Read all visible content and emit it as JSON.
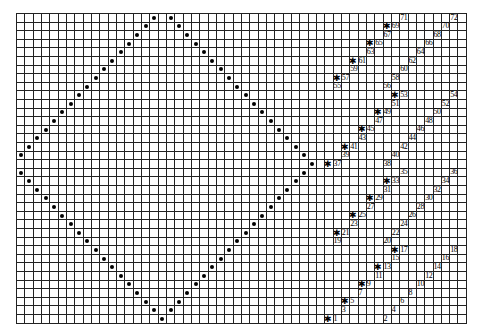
{
  "grid": {
    "cols": 54,
    "rows": 36,
    "cell_w": 8.33,
    "cell_h": 8.6,
    "line_color": "#222222"
  },
  "diamond_dots": [
    [
      0,
      16
    ],
    [
      0,
      18
    ],
    [
      1,
      15
    ],
    [
      1,
      19
    ],
    [
      2,
      14
    ],
    [
      2,
      20
    ],
    [
      3,
      13
    ],
    [
      3,
      21
    ],
    [
      4,
      12
    ],
    [
      4,
      22
    ],
    [
      5,
      11
    ],
    [
      5,
      23
    ],
    [
      6,
      10
    ],
    [
      6,
      24
    ],
    [
      7,
      9
    ],
    [
      7,
      25
    ],
    [
      8,
      8
    ],
    [
      8,
      26
    ],
    [
      9,
      7
    ],
    [
      9,
      27
    ],
    [
      10,
      6
    ],
    [
      10,
      28
    ],
    [
      11,
      5
    ],
    [
      11,
      29
    ],
    [
      12,
      4
    ],
    [
      12,
      30
    ],
    [
      13,
      3
    ],
    [
      13,
      31
    ],
    [
      14,
      2
    ],
    [
      14,
      32
    ],
    [
      15,
      1
    ],
    [
      15,
      33
    ],
    [
      16,
      0
    ],
    [
      16,
      34
    ],
    [
      17,
      35
    ],
    [
      18,
      0
    ],
    [
      18,
      34
    ],
    [
      19,
      1
    ],
    [
      19,
      33
    ],
    [
      20,
      2
    ],
    [
      20,
      32
    ],
    [
      21,
      3
    ],
    [
      21,
      31
    ],
    [
      22,
      4
    ],
    [
      22,
      30
    ],
    [
      23,
      5
    ],
    [
      23,
      29
    ],
    [
      24,
      6
    ],
    [
      24,
      28
    ],
    [
      25,
      7
    ],
    [
      25,
      27
    ],
    [
      26,
      8
    ],
    [
      26,
      26
    ],
    [
      27,
      9
    ],
    [
      27,
      25
    ],
    [
      28,
      10
    ],
    [
      28,
      24
    ],
    [
      29,
      11
    ],
    [
      29,
      23
    ],
    [
      30,
      12
    ],
    [
      30,
      22
    ],
    [
      31,
      13
    ],
    [
      31,
      21
    ],
    [
      32,
      14
    ],
    [
      32,
      20
    ],
    [
      33,
      15
    ],
    [
      33,
      19
    ],
    [
      34,
      16
    ],
    [
      34,
      18
    ],
    [
      35,
      17
    ]
  ],
  "star_symbol": "✱",
  "labels": [
    {
      "text": "1",
      "row": 35,
      "col": 38,
      "star": 37
    },
    {
      "text": "2",
      "row": 35,
      "col": 44
    },
    {
      "text": "3",
      "row": 34,
      "col": 39
    },
    {
      "text": "4",
      "row": 34,
      "col": 45
    },
    {
      "text": "5",
      "row": 33,
      "col": 40,
      "star": 39
    },
    {
      "text": "6",
      "row": 33,
      "col": 46
    },
    {
      "text": "7",
      "row": 32,
      "col": 41
    },
    {
      "text": "8",
      "row": 32,
      "col": 47
    },
    {
      "text": "9",
      "row": 31,
      "col": 42,
      "star": 41
    },
    {
      "text": "10",
      "row": 31,
      "col": 48
    },
    {
      "text": "11",
      "row": 30,
      "col": 43
    },
    {
      "text": "12",
      "row": 30,
      "col": 49
    },
    {
      "text": "13",
      "row": 29,
      "col": 44,
      "star": 43
    },
    {
      "text": "14",
      "row": 29,
      "col": 50
    },
    {
      "text": "15",
      "row": 28,
      "col": 45
    },
    {
      "text": "16",
      "row": 28,
      "col": 51
    },
    {
      "text": "17",
      "row": 27,
      "col": 46,
      "star": 45
    },
    {
      "text": "18",
      "row": 27,
      "col": 52
    },
    {
      "text": "19",
      "row": 26,
      "col": 38
    },
    {
      "text": "20",
      "row": 26,
      "col": 44
    },
    {
      "text": "21",
      "row": 25,
      "col": 39,
      "star": 38
    },
    {
      "text": "22",
      "row": 25,
      "col": 45
    },
    {
      "text": "23",
      "row": 24,
      "col": 40
    },
    {
      "text": "24",
      "row": 24,
      "col": 46
    },
    {
      "text": "25",
      "row": 23,
      "col": 41,
      "star": 40
    },
    {
      "text": "26",
      "row": 23,
      "col": 47
    },
    {
      "text": "27",
      "row": 22,
      "col": 42
    },
    {
      "text": "28",
      "row": 22,
      "col": 48
    },
    {
      "text": "29",
      "row": 21,
      "col": 43,
      "star": 42
    },
    {
      "text": "30",
      "row": 21,
      "col": 49
    },
    {
      "text": "31",
      "row": 20,
      "col": 44
    },
    {
      "text": "32",
      "row": 20,
      "col": 50
    },
    {
      "text": "33",
      "row": 19,
      "col": 45,
      "star": 44
    },
    {
      "text": "34",
      "row": 19,
      "col": 51
    },
    {
      "text": "35",
      "row": 18,
      "col": 46
    },
    {
      "text": "36",
      "row": 18,
      "col": 52
    },
    {
      "text": "37",
      "row": 17,
      "col": 38,
      "star": 37
    },
    {
      "text": "38",
      "row": 17,
      "col": 44
    },
    {
      "text": "39",
      "row": 16,
      "col": 39
    },
    {
      "text": "40",
      "row": 16,
      "col": 45
    },
    {
      "text": "41",
      "row": 15,
      "col": 40,
      "star": 39
    },
    {
      "text": "42",
      "row": 15,
      "col": 46
    },
    {
      "text": "43",
      "row": 14,
      "col": 41
    },
    {
      "text": "44",
      "row": 14,
      "col": 47
    },
    {
      "text": "45",
      "row": 13,
      "col": 42,
      "star": 41
    },
    {
      "text": "46",
      "row": 13,
      "col": 48
    },
    {
      "text": "47",
      "row": 12,
      "col": 43
    },
    {
      "text": "48",
      "row": 12,
      "col": 49
    },
    {
      "text": "49",
      "row": 11,
      "col": 44,
      "star": 43
    },
    {
      "text": "50",
      "row": 11,
      "col": 50
    },
    {
      "text": "51",
      "row": 10,
      "col": 45
    },
    {
      "text": "52",
      "row": 10,
      "col": 51
    },
    {
      "text": "53",
      "row": 9,
      "col": 46,
      "star": 45
    },
    {
      "text": "54",
      "row": 9,
      "col": 52
    },
    {
      "text": "55",
      "row": 8,
      "col": 38
    },
    {
      "text": "56",
      "row": 8,
      "col": 44
    },
    {
      "text": "57",
      "row": 7,
      "col": 39,
      "star": 38
    },
    {
      "text": "58",
      "row": 7,
      "col": 45
    },
    {
      "text": "59",
      "row": 6,
      "col": 40
    },
    {
      "text": "60",
      "row": 6,
      "col": 46
    },
    {
      "text": "61",
      "row": 5,
      "col": 41,
      "star": 40
    },
    {
      "text": "62",
      "row": 5,
      "col": 47
    },
    {
      "text": "63",
      "row": 4,
      "col": 42
    },
    {
      "text": "64",
      "row": 4,
      "col": 48
    },
    {
      "text": "65",
      "row": 3,
      "col": 43,
      "star": 42
    },
    {
      "text": "66",
      "row": 3,
      "col": 49
    },
    {
      "text": "67",
      "row": 2,
      "col": 44
    },
    {
      "text": "68",
      "row": 2,
      "col": 50
    },
    {
      "text": "69",
      "row": 1,
      "col": 45,
      "star": 44
    },
    {
      "text": "70",
      "row": 1,
      "col": 51
    },
    {
      "text": "71",
      "row": 0,
      "col": 46
    },
    {
      "text": "72",
      "row": 0,
      "col": 52
    }
  ]
}
